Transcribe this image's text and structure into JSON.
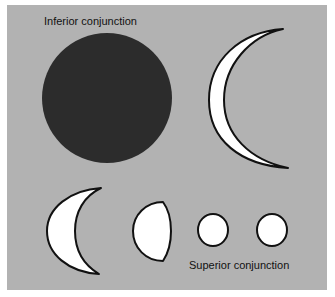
{
  "figure": {
    "labels": {
      "inferior": "Inferior conjunction",
      "superior": "Superior conjunction"
    },
    "colors": {
      "background": "#b2b2b2",
      "dark_disk": "#2c2c2c",
      "lit": "#ffffff",
      "outline": "#111111"
    },
    "phases": [
      {
        "name": "inferior-conjunction",
        "shape": "dark disk"
      },
      {
        "name": "thin-crescent",
        "shape": "large thin crescent"
      },
      {
        "name": "crescent",
        "shape": "crescent"
      },
      {
        "name": "gibbous",
        "shape": "gibbous"
      },
      {
        "name": "nearly-full",
        "shape": "small disk"
      },
      {
        "name": "superior-conjunction",
        "shape": "small full disk"
      }
    ]
  }
}
